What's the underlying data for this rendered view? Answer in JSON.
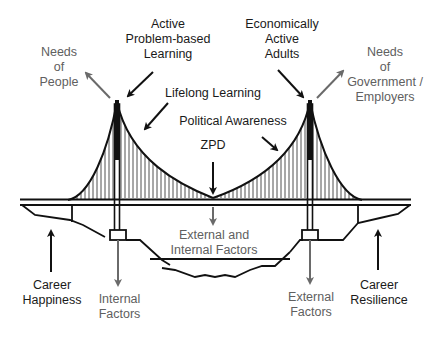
{
  "diagram": {
    "colors": {
      "structure": "#111111",
      "dark_arrow": "#111111",
      "grey_arrow": "#6a6a6a",
      "dark_text": "#1a1a1a",
      "grey_text": "#606060",
      "background": "#ffffff"
    },
    "labels": {
      "needs_of_people": [
        "Needs",
        "of",
        "People"
      ],
      "active_learning": [
        "Active",
        "Problem-based",
        "Learning"
      ],
      "economically_active": [
        "Economically",
        "Active",
        "Adults"
      ],
      "needs_of_government": [
        "Needs",
        "of",
        "Government /",
        "Employers"
      ],
      "lifelong_learning": "Lifelong Learning",
      "political_awareness": "Political Awareness",
      "zpd": "ZPD",
      "external_internal": [
        "External and",
        "Internal Factors"
      ],
      "career_happiness": [
        "Career",
        "Happiness"
      ],
      "internal_factors": [
        "Internal",
        "Factors"
      ],
      "external_factors": [
        "External",
        "Factors"
      ],
      "career_resilience": [
        "Career",
        "Resilience"
      ]
    }
  }
}
